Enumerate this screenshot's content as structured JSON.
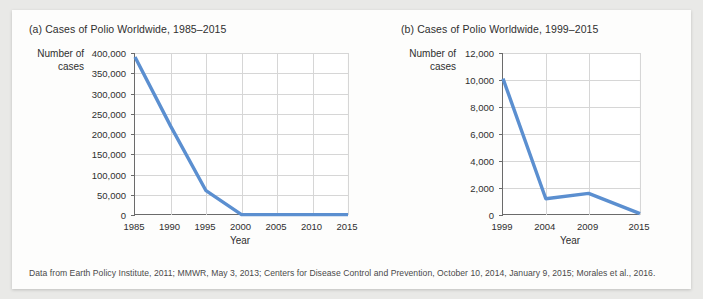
{
  "figure": {
    "caption": "Data from Earth Policy Institute, 2011; MMWR, May 3, 2013; Centers for Disease Control and Prevention, October 10, 2014, January 9, 2015; Morales et al., 2016.",
    "line_color": "#5b8fd0",
    "panel_background": "#ffffff",
    "gridline_color": "#d6d6d6",
    "axis_color": "#6b6b6b"
  },
  "chart_data": [
    {
      "type": "line",
      "id": "chart-a",
      "title": "(a) Cases of Polio Worldwide, 1985–2015",
      "ylabel_line1": "Number of",
      "ylabel_line2": "cases",
      "xlabel": "Year",
      "x": [
        1985,
        1990,
        1995,
        2000,
        2005,
        2010,
        2015
      ],
      "values": [
        390000,
        220000,
        60000,
        1000,
        1000,
        1000,
        1000
      ],
      "xtick_labels": [
        "1985",
        "1990",
        "1995",
        "2000",
        "2005",
        "2010",
        "2015"
      ],
      "ytick_labels": [
        "0",
        "50,000",
        "100,000",
        "150,000",
        "200,000",
        "250,000",
        "300,000",
        "350,000",
        "400,000"
      ],
      "ytick_values": [
        0,
        50000,
        100000,
        150000,
        200000,
        250000,
        300000,
        350000,
        400000
      ],
      "xlim": [
        1985,
        2015
      ],
      "ylim": [
        0,
        400000
      ],
      "grid": true,
      "legend": "none"
    },
    {
      "type": "line",
      "id": "chart-b",
      "title": "(b) Cases of Polio Worldwide, 1999–2015",
      "ylabel_line1": "Number of",
      "ylabel_line2": "cases",
      "xlabel": "Year",
      "x": [
        1999,
        2004,
        2009,
        2015
      ],
      "values": [
        10100,
        1200,
        1600,
        100
      ],
      "xtick_labels": [
        "1999",
        "2004",
        "2009",
        "2015"
      ],
      "ytick_labels": [
        "0",
        "2,000",
        "4,000",
        "6,000",
        "8,000",
        "10,000",
        "12,000"
      ],
      "ytick_values": [
        0,
        2000,
        4000,
        6000,
        8000,
        10000,
        12000
      ],
      "xlim": [
        1999,
        2015
      ],
      "ylim": [
        0,
        12000
      ],
      "grid": true,
      "legend": "none"
    }
  ]
}
